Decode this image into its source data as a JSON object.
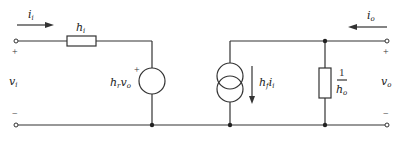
{
  "diagram": {
    "input": {
      "current_label": "i",
      "current_sub": "i",
      "voltage_label": "v",
      "voltage_sub": "i",
      "plus": "+",
      "minus": "−"
    },
    "output": {
      "current_label": "i",
      "current_sub": "o",
      "voltage_label": "v",
      "voltage_sub": "o",
      "plus": "+",
      "minus": "−"
    },
    "input_resistor": {
      "label": "h",
      "sub": "i"
    },
    "voltage_source": {
      "label_h": "h",
      "label_sub": "r",
      "label_v": "v",
      "label_vsub": "o",
      "plus": "+"
    },
    "current_source": {
      "label_h": "h",
      "label_sub": "f",
      "label_i": "i",
      "label_isub": "i"
    },
    "output_resistor": {
      "numerator": "1",
      "den_h": "h",
      "den_sub": "o"
    },
    "colors": {
      "line": "#333333",
      "background": "#ffffff"
    }
  }
}
